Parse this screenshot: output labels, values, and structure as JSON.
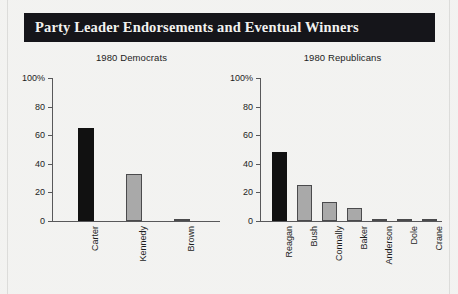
{
  "banner": {
    "title": "Party Leader Endorsements and Eventual Winners",
    "background_color": "#15151a",
    "text_color": "#f2f2f0"
  },
  "colors": {
    "winner_bar": "#111111",
    "other_bar": "#a9a9a9",
    "axis": "#58585a",
    "background": "#ececea"
  },
  "chart_data": [
    {
      "type": "bar",
      "title": "1980 Democrats",
      "xlabel": "",
      "ylabel": "",
      "ylim": [
        0,
        100
      ],
      "yticks": [
        "0",
        "20",
        "40",
        "60",
        "80",
        "100%"
      ],
      "ytick_values": [
        0,
        20,
        40,
        60,
        80,
        100
      ],
      "grid": false,
      "legend": "none",
      "categories": [
        "Carter",
        "Kennedy",
        "Brown"
      ],
      "values": [
        65,
        33,
        1.5
      ],
      "winners": [
        "Carter"
      ],
      "bar_colors": [
        "#111111",
        "#a9a9a9",
        "#a9a9a9"
      ]
    },
    {
      "type": "bar",
      "title": "1980 Republicans",
      "xlabel": "",
      "ylabel": "",
      "ylim": [
        0,
        100
      ],
      "yticks": [
        "0",
        "20",
        "40",
        "60",
        "80",
        "100%"
      ],
      "ytick_values": [
        0,
        20,
        40,
        60,
        80,
        100
      ],
      "grid": false,
      "legend": "none",
      "categories": [
        "Reagan",
        "Bush",
        "Connally",
        "Baker",
        "Anderson",
        "Dole",
        "Crane"
      ],
      "values": [
        48,
        25.5,
        13,
        9,
        1.2,
        1.2,
        0.8
      ],
      "winners": [
        "Reagan"
      ],
      "bar_colors": [
        "#111111",
        "#a9a9a9",
        "#a9a9a9",
        "#a9a9a9",
        "#a9a9a9",
        "#a9a9a9",
        "#a9a9a9"
      ]
    }
  ]
}
